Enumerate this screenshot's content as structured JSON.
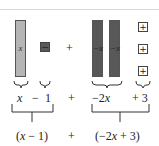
{
  "diagram": {
    "tiles": {
      "x_tile": {
        "label": "x",
        "color": "#b5b5b5"
      },
      "neg_one_tile": {
        "label": "−",
        "color": "#5a5a5a"
      },
      "neg_x_tiles": [
        {
          "label": "−x",
          "color": "#585858"
        },
        {
          "label": "−x",
          "color": "#585858"
        }
      ],
      "pos_one_tiles": [
        {
          "label": "+"
        },
        {
          "label": "+"
        },
        {
          "label": "+"
        }
      ]
    },
    "tile_plus": "+",
    "row1": {
      "term1_var": "x",
      "term1_op": "−",
      "term1_const": "1",
      "plus": "+",
      "term2_coef": "−2",
      "term2_var": "x",
      "term2_const": "+ 3"
    },
    "row2": {
      "group1_open": "(",
      "group1_var": "x",
      "group1_rest": " − 1)",
      "plus": "+",
      "group2_open": "(−2",
      "group2_var": "x",
      "group2_rest": " + 3)"
    }
  }
}
